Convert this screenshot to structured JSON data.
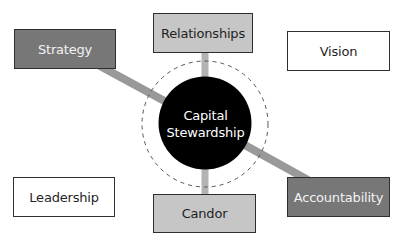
{
  "diagram": {
    "center": {
      "line1": "Capital",
      "line2": "Stewardship"
    },
    "nodes": [
      {
        "id": "strategy",
        "label": "Strategy",
        "style": "dark"
      },
      {
        "id": "relationships",
        "label": "Relationships",
        "style": "light"
      },
      {
        "id": "vision",
        "label": "Vision",
        "style": "white"
      },
      {
        "id": "leadership",
        "label": "Leadership",
        "style": "white"
      },
      {
        "id": "candor",
        "label": "Candor",
        "style": "light"
      },
      {
        "id": "accountability",
        "label": "Accountability",
        "style": "dark"
      }
    ],
    "connections": [
      {
        "from": "strategy",
        "to": "center"
      },
      {
        "from": "relationships",
        "to": "center"
      },
      {
        "from": "center",
        "to": "candor"
      },
      {
        "from": "center",
        "to": "accountability"
      }
    ],
    "colors": {
      "dark_box": "#777777",
      "light_box": "#c6c6c6",
      "white_box": "#ffffff",
      "center_circle": "#000000",
      "diagonal_connector": "#999999",
      "vertical_connector": "#b3b3b3",
      "dashed_ring": "#555555"
    }
  }
}
